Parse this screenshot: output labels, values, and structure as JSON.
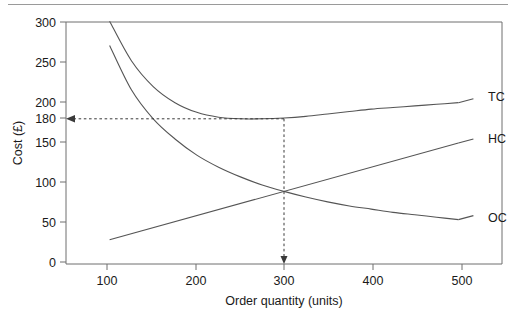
{
  "figure": {
    "has_top_rule": true,
    "frame_color": "#6f6f6f"
  },
  "chart_data": {
    "type": "line",
    "title": "",
    "xlabel": "Order quantity (units)",
    "ylabel": "Cost (£)",
    "xlim": [
      50,
      550
    ],
    "ylim": [
      0,
      300
    ],
    "xticks": [
      "100",
      "200",
      "300",
      "400",
      "500"
    ],
    "xtick_values": [
      100,
      200,
      300,
      400,
      500
    ],
    "yticks": [
      "0",
      "50",
      "100",
      "150",
      "180",
      "200",
      "250",
      "300"
    ],
    "ytick_values": [
      0,
      50,
      100,
      150,
      180,
      200,
      250,
      300
    ],
    "grid": false,
    "legend_position": "right-inline",
    "x": [
      100,
      125,
      150,
      175,
      200,
      225,
      250,
      275,
      300,
      325,
      350,
      375,
      400,
      425,
      450,
      475,
      500
    ],
    "series": [
      {
        "name": "TC",
        "label": "TC",
        "description": "Total cost",
        "values": [
          301,
          252,
          220,
          200,
          188,
          182,
          180,
          180,
          181,
          183,
          186,
          189,
          192,
          194,
          196,
          198,
          200
        ]
      },
      {
        "name": "HC",
        "label": "HC",
        "description": "Holding cost",
        "values": [
          30,
          37,
          45,
          52,
          60,
          67,
          75,
          82,
          90,
          97,
          105,
          112,
          120,
          127,
          135,
          142,
          150
        ]
      },
      {
        "name": "OC",
        "label": "OC",
        "description": "Ordering cost",
        "values": [
          271,
          216,
          180,
          155,
          135,
          120,
          108,
          98,
          90,
          83,
          77,
          72,
          68,
          64,
          61,
          58,
          55
        ]
      }
    ],
    "annotations": [
      {
        "name": "eoq-vertical-guide",
        "kind": "dashed-vertical-arrow",
        "x": 300,
        "y_from": 180,
        "y_to": 0,
        "label": "300"
      },
      {
        "name": "min-cost-horizontal-guide",
        "kind": "dashed-horizontal-arrow",
        "y": 180,
        "x_from": 300,
        "x_to": 50,
        "label": "180"
      }
    ],
    "highlight_values": {
      "eoq_quantity": "300",
      "minimum_total_cost": "180",
      "intersection_cost": "90"
    }
  }
}
